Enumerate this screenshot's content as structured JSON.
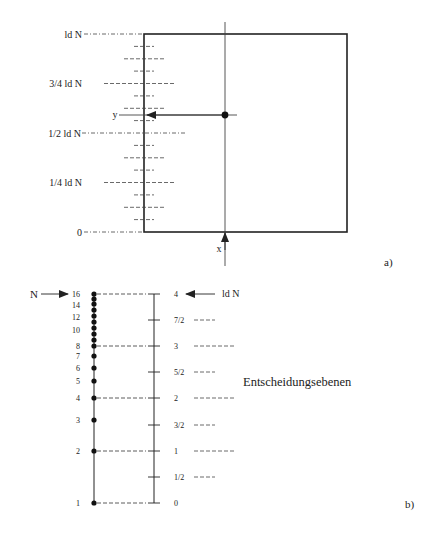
{
  "figure_a": {
    "label": "a)",
    "y_axis_labels": {
      "top": "ld N",
      "three_quarter": "3/4 ld N",
      "half": "1/2 ld N",
      "quarter": "1/4 ld N",
      "zero": "0"
    },
    "axis_x_label": "x",
    "axis_y_label": "y"
  },
  "figure_b": {
    "label": "b)",
    "n_arrow_label": "N",
    "ldn_arrow_label": "ld N",
    "n_values": [
      "16",
      "14",
      "12",
      "10",
      "8",
      "7",
      "6",
      "5",
      "4",
      "3",
      "2",
      "1"
    ],
    "ld_values": [
      "4",
      "7/2",
      "3",
      "5/2",
      "2",
      "3/2",
      "1",
      "1/2",
      "0"
    ],
    "decision_planes_label": "Entscheidungsebenen"
  },
  "colors": {
    "ink": "#222222",
    "background": "#ffffff"
  }
}
